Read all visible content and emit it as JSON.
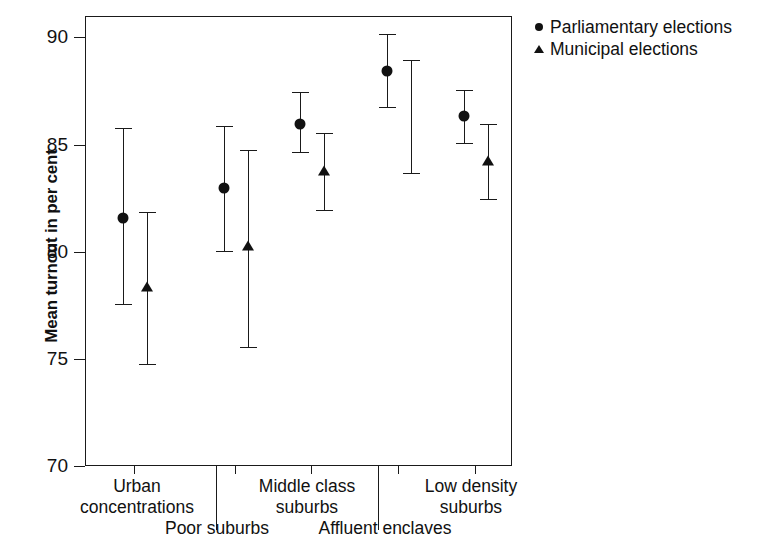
{
  "chart_data": {
    "type": "scatter",
    "title": "",
    "xlabel": "",
    "ylabel": "Mean turnout in per cent",
    "ylim": [
      70,
      91
    ],
    "yticks": [
      70,
      75,
      80,
      85,
      90
    ],
    "ytick_labels": [
      "70",
      "75",
      "80",
      "85",
      "90"
    ],
    "grid": false,
    "legend_position": "right-top",
    "error_bars": "confidence interval caps",
    "categories": [
      "Urban\nconcentrations",
      "Poor suburbs",
      "Middle class\nsuburbs",
      "Affluent enclaves",
      "Low density\nsuburbs"
    ],
    "series": [
      {
        "name": "Parliamentary elections",
        "marker": "circle",
        "color": "#111111",
        "values": [
          81.6,
          83.0,
          86.0,
          88.5,
          86.4
        ],
        "ci_low": [
          77.6,
          80.1,
          84.7,
          86.8,
          85.1
        ],
        "ci_high": [
          85.8,
          85.9,
          87.5,
          90.2,
          87.6
        ]
      },
      {
        "name": "Municipal elections",
        "marker": "triangle",
        "color": "#111111",
        "values": [
          78.4,
          80.3,
          83.8,
          null,
          84.3
        ],
        "ci_low": [
          74.8,
          75.6,
          82.0,
          83.7,
          82.5
        ],
        "ci_high": [
          81.9,
          84.8,
          85.6,
          89.0,
          86.0
        ]
      }
    ]
  },
  "legend": {
    "items": [
      {
        "label": "Parliamentary elections",
        "marker": "circle"
      },
      {
        "label": "Municipal elections",
        "marker": "triangle"
      }
    ]
  }
}
